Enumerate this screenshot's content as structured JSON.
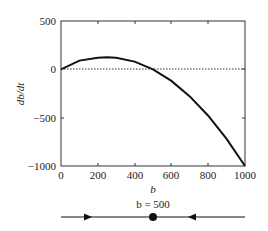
{
  "chart_data": {
    "type": "line",
    "title": "",
    "xlabel": "b",
    "ylabel": "db/dt",
    "xlim": [
      0,
      1000
    ],
    "ylim": [
      -1000,
      500
    ],
    "xticks": [
      0,
      200,
      400,
      600,
      800,
      1000
    ],
    "yticks": [
      500,
      0,
      -500,
      -1000
    ],
    "x_tick_labels": [
      "0",
      "200",
      "400",
      "600",
      "800",
      "1000"
    ],
    "y_tick_labels": [
      "500",
      "0",
      "−500",
      "−1000"
    ],
    "grid": false,
    "reference_line": {
      "y": 0,
      "style": "dotted"
    },
    "series": [
      {
        "name": "db/dt",
        "x": [
          0,
          100,
          200,
          250,
          300,
          400,
          500,
          600,
          700,
          800,
          900,
          1000
        ],
        "values": [
          0,
          90,
          120,
          125,
          120,
          80,
          0,
          -120,
          -280,
          -480,
          -720,
          -1000
        ]
      }
    ],
    "phase_line": {
      "label": "b = 500",
      "equilibrium": 500,
      "arrows": [
        "right",
        "left"
      ],
      "stable": true
    }
  }
}
